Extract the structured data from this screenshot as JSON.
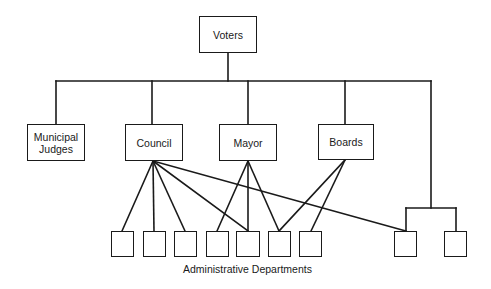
{
  "diagram": {
    "title": "",
    "nodes": {
      "voters": {
        "label": "Voters"
      },
      "municipal_judges": {
        "label": "Municipal\nJudges",
        "line1": "Municipal",
        "line2": "Judges"
      },
      "council": {
        "label": "Council"
      },
      "mayor": {
        "label": "Mayor"
      },
      "boards": {
        "label": "Boards"
      }
    },
    "departments_caption": "Administrative Departments",
    "department_count": 9,
    "edges": [
      {
        "from": "voters",
        "to": "municipal_judges"
      },
      {
        "from": "voters",
        "to": "council"
      },
      {
        "from": "voters",
        "to": "mayor"
      },
      {
        "from": "voters",
        "to": "boards"
      },
      {
        "from": "voters",
        "to": "dept-8"
      },
      {
        "from": "voters",
        "to": "dept-9"
      },
      {
        "from": "council",
        "to": "dept-1"
      },
      {
        "from": "council",
        "to": "dept-2"
      },
      {
        "from": "council",
        "to": "dept-3"
      },
      {
        "from": "council",
        "to": "dept-5"
      },
      {
        "from": "council",
        "to": "dept-8"
      },
      {
        "from": "mayor",
        "to": "dept-4"
      },
      {
        "from": "mayor",
        "to": "dept-5"
      },
      {
        "from": "mayor",
        "to": "dept-6"
      },
      {
        "from": "boards",
        "to": "dept-6"
      },
      {
        "from": "boards",
        "to": "dept-7"
      }
    ],
    "colors": {
      "line": "#1a1a1a",
      "background": "#ffffff"
    }
  }
}
